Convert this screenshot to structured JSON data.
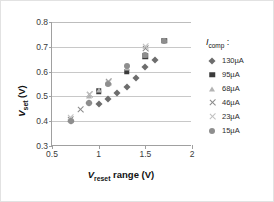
{
  "chart_data": {
    "type": "scatter",
    "title": "",
    "xlabel": "V_reset range (V)",
    "ylabel": "V_set (V)",
    "xlim": [
      0.5,
      2.0
    ],
    "ylim": [
      0.3,
      0.8
    ],
    "xticks": [
      "0.5",
      "1",
      "1.5",
      "2"
    ],
    "xtick_values": [
      0.5,
      1.0,
      1.5,
      2.0
    ],
    "yticks": [
      "0.3",
      "0.4",
      "0.5",
      "0.6",
      "0.7",
      "0.8"
    ],
    "ytick_values": [
      0.3,
      0.4,
      0.5,
      0.6,
      0.7,
      0.8
    ],
    "grid": "horizontal",
    "legend_position": "right",
    "legend_title": "Icomp :",
    "series": [
      {
        "name": "130µA",
        "marker": "diamond",
        "color": "#6d6d6d",
        "x": [
          0.7,
          0.9,
          1.0,
          1.1,
          1.2,
          1.3,
          1.4,
          1.5,
          1.6
        ],
        "y": [
          0.402,
          0.472,
          0.47,
          0.49,
          0.513,
          0.537,
          0.576,
          0.619,
          0.648
        ]
      },
      {
        "name": "95µA",
        "marker": "square",
        "color": "#3b3b3b",
        "x": [
          1.0,
          1.3,
          1.5,
          1.7
        ],
        "y": [
          0.521,
          0.6,
          0.662,
          0.724
        ]
      },
      {
        "name": "68µA",
        "marker": "triangle",
        "color": "#b4b4b4",
        "x": [
          0.9,
          1.0,
          1.1,
          1.3,
          1.5,
          1.7
        ],
        "y": [
          0.503,
          0.525,
          0.556,
          0.614,
          0.668,
          0.728
        ]
      },
      {
        "name": "46µA",
        "marker": "cross",
        "color": "#8a8a8a",
        "x": [
          0.7,
          0.8,
          0.9,
          1.1,
          1.5
        ],
        "y": [
          0.408,
          0.447,
          0.507,
          0.561,
          0.694
        ]
      },
      {
        "name": "23µA",
        "marker": "x",
        "color": "#c0c0c0",
        "x": [
          0.7,
          0.9,
          1.1,
          1.5
        ],
        "y": [
          0.414,
          0.509,
          0.558,
          0.7
        ]
      },
      {
        "name": "15µA",
        "marker": "circle",
        "color": "#8e8e8e",
        "x": [
          0.7,
          0.9,
          1.1,
          1.3,
          1.5,
          1.7
        ],
        "y": [
          0.4,
          0.473,
          0.551,
          0.622,
          0.666,
          0.722
        ]
      }
    ]
  }
}
